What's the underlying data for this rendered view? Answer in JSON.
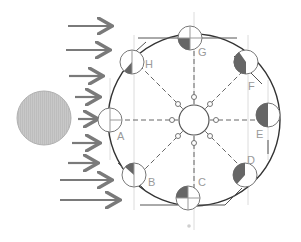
{
  "diagram": {
    "title": "",
    "sun": {
      "label": "",
      "color": "#c4c4c4"
    },
    "earth": {
      "label": ""
    },
    "sunlight_arrows": 9,
    "moon_positions": [
      {
        "label": "A",
        "angle_deg": 180,
        "phase": "new"
      },
      {
        "label": "B",
        "angle_deg": 135,
        "phase": "crescent"
      },
      {
        "label": "C",
        "angle_deg": 90,
        "phase": "quarter"
      },
      {
        "label": "D",
        "angle_deg": 45,
        "phase": "gibbous"
      },
      {
        "label": "E",
        "angle_deg": 0,
        "phase": "full"
      },
      {
        "label": "F",
        "angle_deg": -45,
        "phase": "gibbous"
      },
      {
        "label": "G",
        "angle_deg": -90,
        "phase": "quarter"
      },
      {
        "label": "H",
        "angle_deg": -135,
        "phase": "crescent"
      }
    ],
    "colors": {
      "line": "#555555",
      "arrow": "#7a7a7a",
      "shade": "#6a6a6a",
      "guide": "#d9d9d9"
    }
  }
}
